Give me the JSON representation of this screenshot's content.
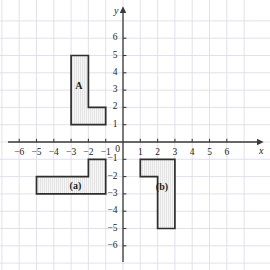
{
  "figure": {
    "kind": "coordinate-grid-diagram",
    "width": 270,
    "height": 270,
    "background_color": "#ffffff",
    "grid_color": "#d9d9e8",
    "axis_color": "#3a3a3a",
    "shape_outline_color": "#2e2e2e",
    "shape_fill_color": "#f4f4f4",
    "shape_hatch_color": "#d7d7d7"
  },
  "chart_data": {
    "type": "scatter",
    "title": "",
    "xlabel": "x",
    "ylabel": "y",
    "grid": true,
    "legend": "none",
    "xlim": [
      -7,
      7
    ],
    "ylim": [
      -7,
      7
    ],
    "x_ticks": [
      -6,
      -5,
      -4,
      -3,
      -2,
      -1,
      0,
      1,
      2,
      3,
      4,
      5,
      6
    ],
    "y_ticks": [
      6,
      5,
      4,
      3,
      2,
      1,
      0,
      -1,
      -2,
      -3,
      -4,
      -5,
      -6
    ],
    "x_tick_labels": [
      "−6",
      "−5",
      "−4",
      "−3",
      "−2",
      "−1",
      "0",
      "1",
      "2",
      "3",
      "4",
      "5",
      "6"
    ],
    "y_tick_labels": [
      "6",
      "5",
      "4",
      "3",
      "2",
      "1",
      "0",
      "−1",
      "−2",
      "−3",
      "−4",
      "−5",
      "−6"
    ],
    "origin_label": "0",
    "shapes": [
      {
        "name": "A",
        "label": "A",
        "label_x": -2.55,
        "label_y": 3.25,
        "vertices": [
          [
            -3,
            5
          ],
          [
            -2,
            5
          ],
          [
            -2,
            2
          ],
          [
            -1,
            2
          ],
          [
            -1,
            1
          ],
          [
            -3,
            1
          ]
        ]
      },
      {
        "name": "a",
        "label": "(a)",
        "label_x": -2.75,
        "label_y": -2.55,
        "vertices": [
          [
            -5,
            -2
          ],
          [
            -2,
            -2
          ],
          [
            -2,
            -1
          ],
          [
            -1,
            -1
          ],
          [
            -1,
            -3
          ],
          [
            -5,
            -3
          ]
        ]
      },
      {
        "name": "b",
        "label": "(b)",
        "label_x": 2.25,
        "label_y": -2.6,
        "vertices": [
          [
            1,
            -1
          ],
          [
            3,
            -1
          ],
          [
            3,
            -5
          ],
          [
            2,
            -5
          ],
          [
            2,
            -2
          ],
          [
            1,
            -2
          ]
        ]
      }
    ]
  },
  "axes": {
    "x_axis_name": "x",
    "y_axis_name": "y"
  }
}
